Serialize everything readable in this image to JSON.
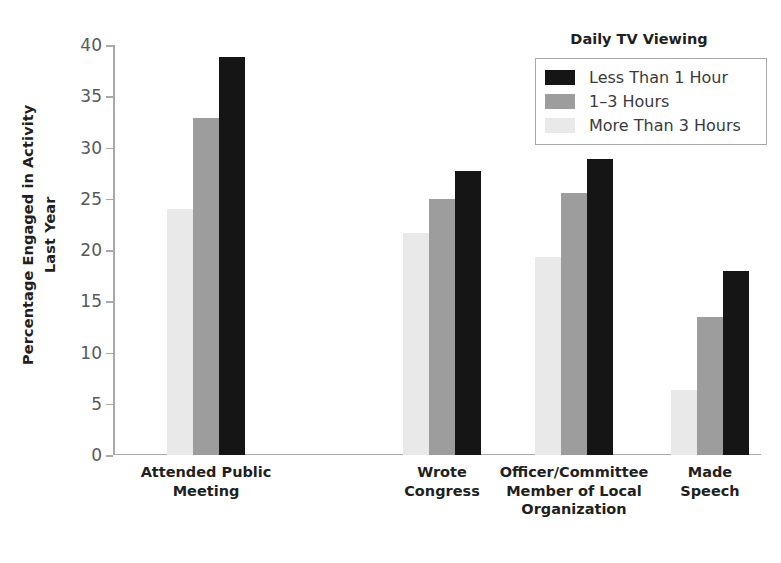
{
  "chart_data": {
    "type": "bar",
    "title": "",
    "xlabel": "",
    "ylabel": "Percentage Engaged in Activity Last Year",
    "ylabel_lines": [
      "Percentage Engaged in Activity",
      "Last Year"
    ],
    "ylim": [
      0,
      40
    ],
    "ytick_step": 5,
    "yticks": [
      0,
      5,
      10,
      15,
      20,
      25,
      30,
      35,
      40
    ],
    "ytick_labels": [
      "0",
      "5",
      "10",
      "15",
      "20",
      "25",
      "30",
      "35",
      "40"
    ],
    "grid": false,
    "legend_title": "Daily TV Viewing",
    "legend_position": "top-right",
    "categories": [
      "Attended Public\nMeeting",
      "Wrote\nCongress",
      "Officer/Committee\nMember of Local\nOrganization",
      "Made\nSpeech"
    ],
    "category_labels_flat": [
      "Attended Public Meeting",
      "Wrote Congress",
      "Officer/Committee Member of Local Organization",
      "Made Speech"
    ],
    "series": [
      {
        "name": "More Than 3 Hours",
        "color": "#e9e9e9",
        "draw_order": 0,
        "values": [
          24.0,
          21.7,
          19.3,
          6.3
        ]
      },
      {
        "name": "1–3 Hours",
        "color": "#9d9d9d",
        "draw_order": 1,
        "values": [
          32.9,
          25.0,
          25.6,
          13.5
        ]
      },
      {
        "name": "Less Than 1 Hour",
        "color": "#151515",
        "draw_order": 2,
        "values": [
          38.8,
          27.7,
          28.9,
          18.0
        ]
      }
    ],
    "legend_entries": [
      {
        "label": "Less Than 1 Hour",
        "color": "#151515"
      },
      {
        "label": "1–3 Hours",
        "color": "#9d9d9d"
      },
      {
        "label": "More Than 3 Hours",
        "color": "#e9e9e9"
      }
    ]
  },
  "colors": {
    "axis": "#a7a9ac",
    "tick_text": "#58595b",
    "label_text": "#231f20",
    "legend_border": "#a7a9ac",
    "background": "#ffffff"
  }
}
